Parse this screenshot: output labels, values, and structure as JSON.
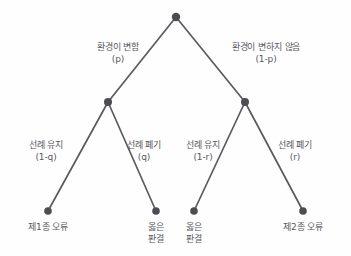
{
  "diagram": {
    "type": "decision-tree",
    "title": "",
    "colors": {
      "background": "#fefefe",
      "edge": "#5a5a60",
      "node": "#4c4c54",
      "text": "#58585e"
    },
    "nodes": [
      {
        "id": "root",
        "x": 176,
        "y": 17,
        "label": ""
      },
      {
        "id": "mid-left",
        "x": 108,
        "y": 102,
        "label": ""
      },
      {
        "id": "mid-right",
        "x": 245,
        "y": 102,
        "label": ""
      },
      {
        "id": "leaf-1",
        "x": 48,
        "y": 211,
        "label": "제1종 오류"
      },
      {
        "id": "leaf-2",
        "x": 156,
        "y": 211,
        "label": "옳은 판결"
      },
      {
        "id": "leaf-3",
        "x": 194,
        "y": 211,
        "label": "옳은 판결"
      },
      {
        "id": "leaf-4",
        "x": 303,
        "y": 211,
        "label": "제2종 오류"
      }
    ],
    "edges": [
      {
        "id": "edge-root-left",
        "from": "root",
        "to": "mid-left"
      },
      {
        "id": "edge-root-right",
        "from": "root",
        "to": "mid-right"
      },
      {
        "id": "edge-midleft-leaf1",
        "from": "mid-left",
        "to": "leaf-1"
      },
      {
        "id": "edge-midleft-leaf2",
        "from": "mid-left",
        "to": "leaf-2"
      },
      {
        "id": "edge-midright-leaf3",
        "from": "mid-right",
        "to": "leaf-3"
      },
      {
        "id": "edge-midright-leaf4",
        "from": "mid-right",
        "to": "leaf-4"
      }
    ],
    "branch_labels": {
      "root_left": {
        "text": "환경이 변함",
        "probability": "(p)"
      },
      "root_right": {
        "text": "환경이 변하지 않음",
        "probability": "(1-p)"
      },
      "left_left": {
        "text": "선례 유지",
        "probability": "(1-q)"
      },
      "left_right": {
        "text": "선례 폐기",
        "probability": "(q)"
      },
      "right_left": {
        "text": "선례 유지",
        "probability": "(1-r)"
      },
      "right_right": {
        "text": "선례 폐기",
        "probability": "(r)"
      }
    },
    "leaf_labels": {
      "leaf_1": {
        "line1": "제1종 오류",
        "line2": ""
      },
      "leaf_2": {
        "line1": "옳은",
        "line2": "판결"
      },
      "leaf_3": {
        "line1": "옳은",
        "line2": "판결"
      },
      "leaf_4": {
        "line1": "제2종 오류",
        "line2": ""
      }
    }
  }
}
